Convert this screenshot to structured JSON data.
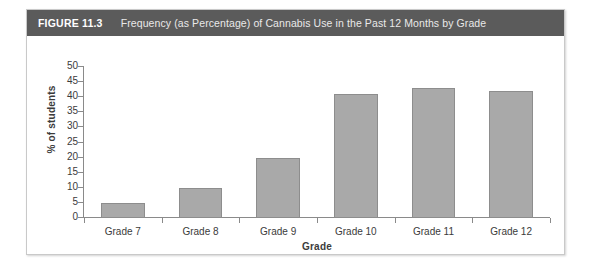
{
  "figure": {
    "label": "FIGURE 11.3",
    "title": "Frequency (as Percentage) of Cannabis Use in the Past 12 Months by Grade"
  },
  "colors": {
    "header_background": "#5b5b5b",
    "header_text": "#ffffff",
    "bar_fill": "#a9a9a9",
    "bar_border": "#8d8d8d",
    "axis": "#8a8a8a",
    "figure_border": "#c9c9c9",
    "page_background": "#ffffff"
  },
  "chart_data": {
    "type": "bar",
    "title": "Frequency (as Percentage) of Cannabis Use in the Past 12 Months by Grade",
    "categories": [
      "Grade 7",
      "Grade 8",
      "Grade 9",
      "Grade 10",
      "Grade 11",
      "Grade 12"
    ],
    "values": [
      5,
      10,
      20,
      41,
      43,
      42
    ],
    "xlabel": "Grade",
    "ylabel": "% of students",
    "ylim": [
      0,
      50
    ],
    "ytick_step": 5,
    "yticks": [
      0,
      5,
      10,
      15,
      20,
      25,
      30,
      35,
      40,
      45,
      50
    ],
    "ytick_labels": [
      "0",
      "5",
      "10",
      "15",
      "20",
      "25",
      "30",
      "35",
      "40",
      "45",
      "50"
    ],
    "grid": false,
    "legend": null,
    "series": [
      {
        "name": "% of students",
        "values": [
          5,
          10,
          20,
          41,
          43,
          42
        ]
      }
    ]
  }
}
